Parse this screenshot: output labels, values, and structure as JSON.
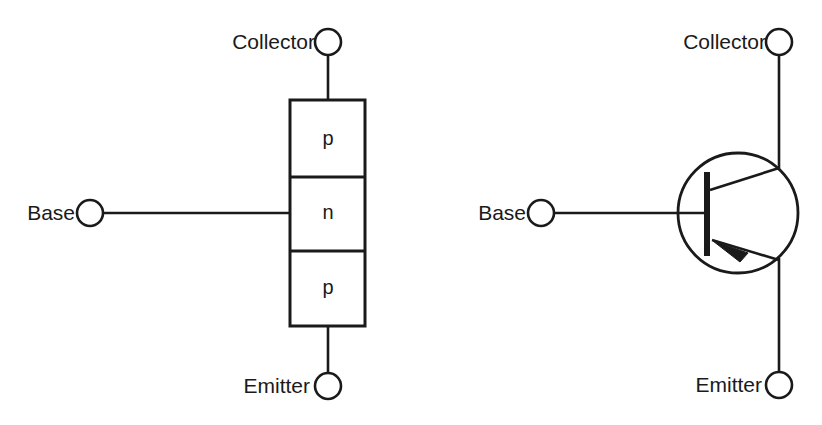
{
  "figure": {
    "background_color": "#ffffff",
    "line_color": "#1a1a1a",
    "text_color": "#1a1a1a"
  },
  "left_diagram": {
    "name": "pnp-layer-structure",
    "terminals": {
      "collector_label": "Collector",
      "base_label": "Base",
      "emitter_label": "Emitter"
    },
    "regions": [
      {
        "layer": "p",
        "position": "top",
        "connects_to": "Collector"
      },
      {
        "layer": "n",
        "position": "middle",
        "connects_to": "Base"
      },
      {
        "layer": "p",
        "position": "bottom",
        "connects_to": "Emitter"
      }
    ],
    "stack_sequence": "p-n-p"
  },
  "right_diagram": {
    "name": "pnp-circuit-symbol",
    "terminals": {
      "collector_label": "Collector",
      "base_label": "Base",
      "emitter_label": "Emitter"
    },
    "arrow_direction": "inward",
    "arrow_on": "emitter",
    "device_type": "PNP"
  },
  "geometry": {
    "left": {
      "box_left": 290,
      "box_right": 365,
      "box_top": 100,
      "box_bottom": 326,
      "divider_1_y": 177,
      "divider_2_y": 251,
      "center_x": 328,
      "collector_circle": {
        "cx": 328,
        "cy": 42,
        "r": 13
      },
      "emitter_circle": {
        "cx": 328,
        "cy": 386,
        "r": 13
      },
      "base_circle": {
        "cx": 90,
        "cy": 213,
        "r": 13
      },
      "base_line_y": 213,
      "collector_label_x": 315,
      "collector_label_y": 42,
      "base_label_x": 75,
      "base_label_y": 213,
      "emitter_label_x": 310,
      "emitter_label_y": 386
    },
    "right": {
      "circle": {
        "cx": 738,
        "cy": 213,
        "r": 60
      },
      "collector_circle": {
        "cx": 779,
        "cy": 42,
        "r": 13
      },
      "emitter_circle": {
        "cx": 779,
        "cy": 385,
        "r": 13
      },
      "base_circle": {
        "cx": 541,
        "cy": 213,
        "r": 13
      },
      "base_bar_x": 707,
      "base_bar_top": 172,
      "base_bar_bottom": 256,
      "base_line_y": 213,
      "vertical_lead_x": 779,
      "collector_join_y": 168,
      "emitter_join_y": 258,
      "collector_label_x": 766,
      "collector_label_y": 42,
      "base_label_x": 526,
      "base_label_y": 213,
      "emitter_label_x": 762,
      "emitter_label_y": 385
    }
  }
}
